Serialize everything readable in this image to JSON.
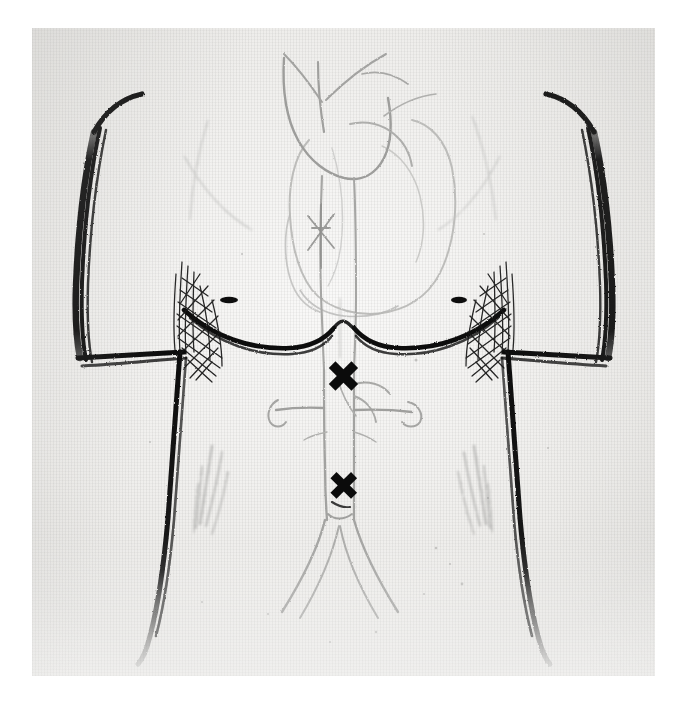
{
  "figure": {
    "title": "Anterior torso with heart and aorta, marked sites",
    "medium": "ink line drawing on textured paper, scanned",
    "view": "anterior (front) view of male trunk",
    "background_color": "#ffffff",
    "paper_color": "#f3f2f0",
    "ink_color": "#0b0b0b",
    "faint_ink_color": "#9a9a98",
    "plate": {
      "left": 32,
      "top": 28,
      "width": 623,
      "height": 648
    }
  },
  "markers": [
    {
      "id": "x-mark-upper",
      "glyph": "✖",
      "label": "X",
      "name": "upper-x-mark",
      "anatomic_site": "suprarenal abdominal aorta, below diaphragm",
      "x": 337,
      "y": 350,
      "size_px": 44,
      "color": "#0b0b0b"
    },
    {
      "id": "x-mark-lower",
      "glyph": "✖",
      "label": "X",
      "name": "lower-x-mark",
      "anatomic_site": "infrarenal aorta above the iliac bifurcation",
      "x": 337,
      "y": 459,
      "size_px": 40,
      "color": "#0b0b0b"
    }
  ],
  "anatomy": {
    "body_outline": {
      "name": "torso-outline",
      "parts": [
        "left-shoulder-and-arm",
        "right-shoulder-and-arm",
        "left-axilla-hatching",
        "right-axilla-hatching",
        "left-pectoral-border",
        "right-pectoral-border",
        "left-nipple",
        "right-nipple",
        "costal-margin",
        "left-flank-line",
        "right-flank-line"
      ]
    },
    "vasculature": {
      "name": "aorta-and-branches",
      "parts": [
        "heart-silhouette",
        "aortic-arch",
        "brachiocephalic-trunk",
        "left-common-carotid-artery",
        "left-subclavian-artery",
        "descending-thoracic-aorta",
        "abdominal-aorta",
        "celiac-trunk",
        "superior-mesenteric-artery",
        "left-renal-artery",
        "right-renal-artery",
        "aortic-bifurcation",
        "left-common-iliac-artery",
        "right-common-iliac-artery"
      ]
    },
    "shading": {
      "name": "abdominal-shading-strokes",
      "parts": [
        "left-oblique-shading",
        "right-oblique-shading"
      ]
    }
  }
}
